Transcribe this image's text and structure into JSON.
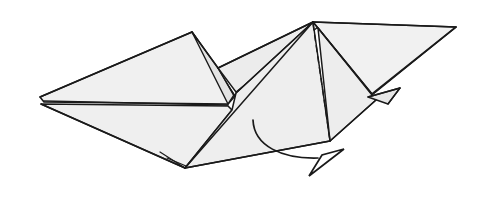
{
  "figure": {
    "kind": "origami-folding-diagram",
    "background_color": "#ffffff",
    "line_color": "#1a1a1a",
    "paper_fill_light": "#f2f2f2",
    "paper_fill_mid": "#ebebeb",
    "paper_fill_shadow": "#e2e2e2",
    "width": 486,
    "height": 212
  },
  "facets": [
    {
      "name": "left-large-wing",
      "fill": "#f0f0f0",
      "stroke_width": 1.6,
      "points": "192,32 40,97 44,102 228,104 235,96"
    },
    {
      "name": "left-lower-wing",
      "fill": "#efefef",
      "stroke_width": 1.6,
      "points": "41,104 185,168 232,110 228,106"
    },
    {
      "name": "center-ridge-sliver",
      "fill": "#e3e3e3",
      "stroke_width": 1.4,
      "points": "192,32 218,68 234,95 228,104"
    },
    {
      "name": "center-upper-band",
      "fill": "#ececec",
      "stroke_width": 1.4,
      "points": "218,68 313,22 318,27 236,92"
    },
    {
      "name": "center-lower-panel",
      "fill": "#eeeeee",
      "stroke_width": 1.5,
      "points": "313,22 236,93 232,110 185,168 330,141"
    },
    {
      "name": "right-upper-wing",
      "fill": "#f1f1f1",
      "stroke_width": 1.6,
      "points": "313,22 456,27 372,94 318,28"
    },
    {
      "name": "right-lower-wing",
      "fill": "#ededed",
      "stroke_width": 1.5,
      "points": "318,28 372,95 376,100 330,141"
    },
    {
      "name": "right-small-flap",
      "fill": "#e6e6e6",
      "stroke_width": 1.4,
      "points": "368,97 400,88 388,104"
    }
  ],
  "creases": [
    {
      "name": "left-wing-center-crease",
      "style": "solid",
      "stroke_width": 1.3,
      "d": "M 44,101 L 228,105"
    },
    {
      "name": "left-tip-upper-edge",
      "style": "solid",
      "stroke_width": 1.5,
      "d": "M 40,97 L 192,32"
    },
    {
      "name": "left-tip-notch",
      "style": "solid",
      "stroke_width": 1.4,
      "d": "M 41,104 L 185,168"
    },
    {
      "name": "ridge-peak-crease",
      "style": "solid",
      "stroke_width": 1.4,
      "d": "M 192,32 L 218,68"
    },
    {
      "name": "ridge-fold-crease",
      "style": "solid",
      "stroke_width": 1.3,
      "d": "M 218,68 L 234,96"
    },
    {
      "name": "apex-spine-left",
      "style": "solid",
      "stroke_width": 1.4,
      "d": "M 313,22 L 218,68"
    },
    {
      "name": "apex-spine-mid",
      "style": "solid",
      "stroke_width": 1.3,
      "d": "M 313,22 L 236,93"
    },
    {
      "name": "apex-to-bottom-tip",
      "style": "solid",
      "stroke_width": 1.5,
      "d": "M 313,22 L 185,168"
    },
    {
      "name": "apex-to-right-corner",
      "style": "solid",
      "stroke_width": 1.4,
      "d": "M 313,22 L 372,94"
    },
    {
      "name": "right-top-edge",
      "style": "solid",
      "stroke_width": 1.4,
      "d": "M 313,22 L 456,27"
    },
    {
      "name": "right-corner-edge",
      "style": "solid",
      "stroke_width": 1.5,
      "d": "M 456,27 L 372,95"
    },
    {
      "name": "bottom-right-edge",
      "style": "solid",
      "stroke_width": 1.5,
      "d": "M 376,100 L 330,141"
    },
    {
      "name": "bottom-long-edge",
      "style": "solid",
      "stroke_width": 1.5,
      "d": "M 330,141 L 185,168"
    },
    {
      "name": "flap-base-line",
      "style": "solid",
      "stroke_width": 1.3,
      "d": "M 368,97 L 400,88"
    },
    {
      "name": "flap-diagonal-line",
      "style": "solid",
      "stroke_width": 1.3,
      "d": "M 400,88 L 388,104"
    },
    {
      "name": "bottom-spike-upper",
      "style": "solid",
      "stroke_width": 1.2,
      "d": "M 160,152 L 185,168"
    },
    {
      "name": "bottom-spike-lower",
      "style": "solid",
      "stroke_width": 1.2,
      "d": "M 167,158 L 186,166"
    },
    {
      "name": "valley-fold-dashed",
      "style": "dashed",
      "stroke_width": 1.4,
      "dash": "6,5",
      "d": "M 313,24 L 330,140"
    }
  ],
  "arrow": {
    "name": "fold-direction-arrow",
    "shaft_d": "M 253,120 C 254,146 282,159 318,158",
    "head_d": "M 344,149 L 309,176 L 322,155 Z",
    "head_tip": "344,149"
  }
}
